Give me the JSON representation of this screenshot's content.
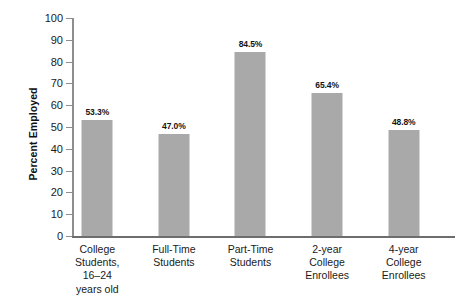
{
  "chart_data": {
    "type": "bar",
    "title": "",
    "xlabel": "",
    "ylabel": "Percent Employed",
    "ylim": [
      0,
      100
    ],
    "ytick_step": 10,
    "ytick_labels": [
      "100",
      "90",
      "80",
      "70",
      "60",
      "50",
      "40",
      "30",
      "20",
      "10",
      "0"
    ],
    "grid": false,
    "legend": null,
    "bar_color": "#a9a9a9",
    "categories": [
      [
        "College",
        "Students,",
        "16–24",
        "years old"
      ],
      [
        "Full-Time",
        "Students"
      ],
      [
        "Part-Time",
        "Students"
      ],
      [
        "2-year",
        "College",
        "Enrollees"
      ],
      [
        "4-year",
        "College",
        "Enrollees"
      ]
    ],
    "values": [
      53.3,
      47.0,
      84.5,
      65.4,
      48.8
    ],
    "value_labels": [
      "53.3%",
      "47.0%",
      "84.5%",
      "65.4%",
      "48.8%"
    ]
  }
}
